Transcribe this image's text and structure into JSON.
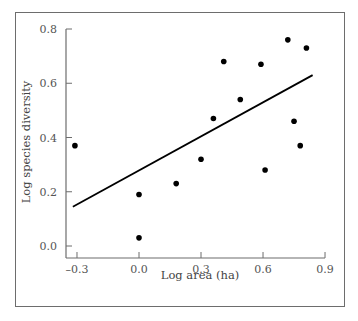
{
  "chart_data": {
    "type": "scatter",
    "title": "",
    "xlabel": "Log area (ha)",
    "ylabel": "Log species diversity",
    "xlim": [
      -0.33,
      0.9
    ],
    "ylim": [
      -0.04,
      0.8
    ],
    "x_ticks": [
      -0.3,
      0.0,
      0.3,
      0.6,
      0.9
    ],
    "x_tick_labels": [
      "–0.3",
      "0.0",
      "0.3",
      "0.6",
      "0.9"
    ],
    "y_ticks": [
      0.0,
      0.2,
      0.4,
      0.6,
      0.8
    ],
    "y_tick_labels": [
      "0.0",
      "0.2",
      "0.4",
      "0.6",
      "0.8"
    ],
    "grid": false,
    "legend": null,
    "series": [
      {
        "name": "observations",
        "type": "scatter",
        "color": "#000000",
        "points": [
          {
            "x": -0.31,
            "y": 0.37
          },
          {
            "x": 0.0,
            "y": 0.19
          },
          {
            "x": 0.0,
            "y": 0.03
          },
          {
            "x": 0.18,
            "y": 0.23
          },
          {
            "x": 0.3,
            "y": 0.32
          },
          {
            "x": 0.36,
            "y": 0.47
          },
          {
            "x": 0.41,
            "y": 0.68
          },
          {
            "x": 0.49,
            "y": 0.54
          },
          {
            "x": 0.59,
            "y": 0.67
          },
          {
            "x": 0.61,
            "y": 0.28
          },
          {
            "x": 0.72,
            "y": 0.76
          },
          {
            "x": 0.75,
            "y": 0.46
          },
          {
            "x": 0.78,
            "y": 0.37
          },
          {
            "x": 0.81,
            "y": 0.73
          }
        ]
      },
      {
        "name": "regression line",
        "type": "line",
        "color": "#000000",
        "points": [
          {
            "x": -0.32,
            "y": 0.145
          },
          {
            "x": 0.84,
            "y": 0.63
          }
        ]
      }
    ]
  }
}
